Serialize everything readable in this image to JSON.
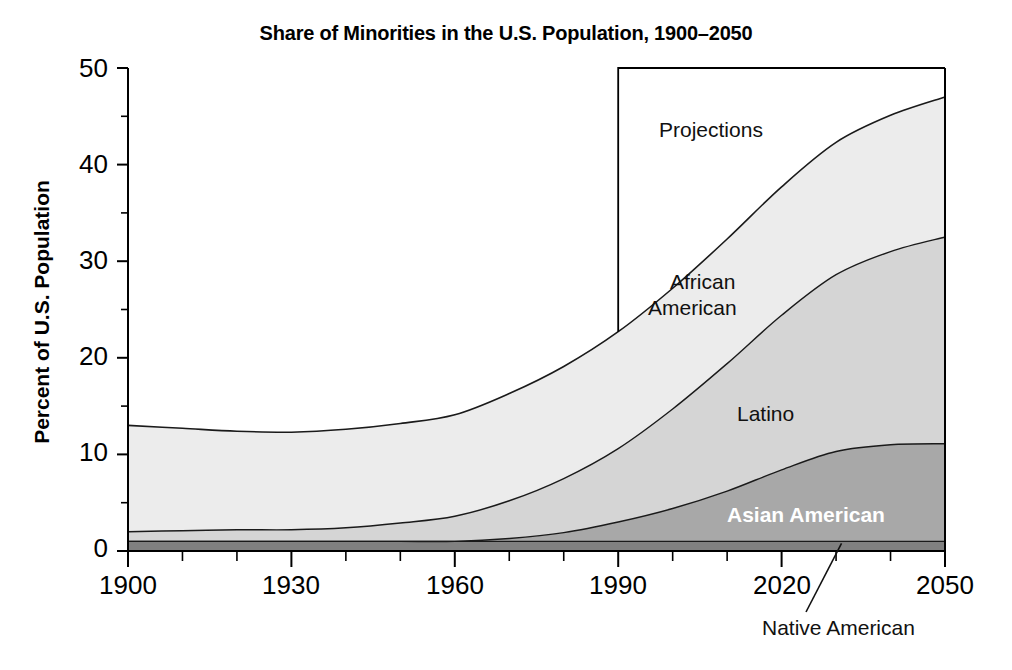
{
  "chart_data": {
    "type": "area",
    "stacked": true,
    "title": "Share of Minorities in the U.S. Population, 1900–2050",
    "xlabel": "",
    "ylabel": "Percent of U.S. Population",
    "xlim": [
      1900,
      2050
    ],
    "ylim": [
      0,
      50
    ],
    "grid": false,
    "legend_position": "inline-labels",
    "x_ticks_major": [
      1900,
      1930,
      1960,
      1990,
      2020,
      2050
    ],
    "x_ticks_minor_step": 10,
    "y_ticks_major": [
      0,
      10,
      20,
      30,
      40,
      50
    ],
    "y_ticks_minor_step": 5,
    "x_tick_labels": [
      "1900",
      "1930",
      "1960",
      "1990",
      "2020",
      "2050"
    ],
    "y_tick_labels": [
      "0",
      "10",
      "20",
      "30",
      "40",
      "50"
    ],
    "x": [
      1900,
      1910,
      1920,
      1930,
      1940,
      1950,
      1960,
      1970,
      1980,
      1990,
      2000,
      2010,
      2020,
      2030,
      2040,
      2050
    ],
    "series": [
      {
        "name": "Native American",
        "label": "Native American",
        "label_style": "callout",
        "color": "#808080",
        "values": [
          1.0,
          1.0,
          1.0,
          1.0,
          1.0,
          1.0,
          1.0,
          1.0,
          1.0,
          1.0,
          1.0,
          1.0,
          1.0,
          1.0,
          1.0,
          1.0
        ]
      },
      {
        "name": "Asian American",
        "label": "Asian American",
        "label_style": "inverse",
        "color": "#a8a8a8",
        "values": [
          0.0,
          0.0,
          0.0,
          0.0,
          0.0,
          0.0,
          0.0,
          0.3,
          0.9,
          2.0,
          3.4,
          5.2,
          7.4,
          9.3,
          10.0,
          10.1
        ]
      },
      {
        "name": "Latino",
        "label": "Latino",
        "label_style": "normal",
        "color": "#d5d5d5",
        "values": [
          1.0,
          1.1,
          1.2,
          1.2,
          1.4,
          1.9,
          2.6,
          3.9,
          5.6,
          7.6,
          10.3,
          13.2,
          16.0,
          18.3,
          20.0,
          21.4
        ]
      },
      {
        "name": "African American",
        "label": "African\nAmerican",
        "label_style": "normal",
        "color": "#ececec",
        "values": [
          11.0,
          10.6,
          10.2,
          10.1,
          10.2,
          10.3,
          10.5,
          11.1,
          11.6,
          12.1,
          12.5,
          12.9,
          13.3,
          13.7,
          14.1,
          14.5
        ]
      }
    ],
    "cumulative_totals": [
      13.0,
      12.7,
      12.4,
      12.3,
      12.6,
      13.2,
      14.1,
      16.3,
      19.1,
      22.7,
      27.2,
      32.3,
      37.7,
      42.3,
      45.1,
      47.0
    ],
    "annotations": [
      {
        "name": "projections",
        "text": "Projections",
        "type": "region-box",
        "x_start": 1990,
        "x_end": 2050,
        "y_top": 50
      },
      {
        "name": "native-american-leader",
        "text": "Native American",
        "type": "leader-line",
        "points_to_x": 2031,
        "points_to_y": 1.0
      }
    ]
  },
  "labels": {
    "projections": "Projections",
    "african_american_line1": "African",
    "african_american_line2": "American",
    "latino": "Latino",
    "asian_american": "Asian American",
    "native_american": "Native American"
  },
  "colors": {
    "african_american": "#ececec",
    "latino": "#d5d5d5",
    "asian_american": "#a8a8a8",
    "native_american": "#808080",
    "axis": "#000000",
    "background": "#ffffff"
  }
}
